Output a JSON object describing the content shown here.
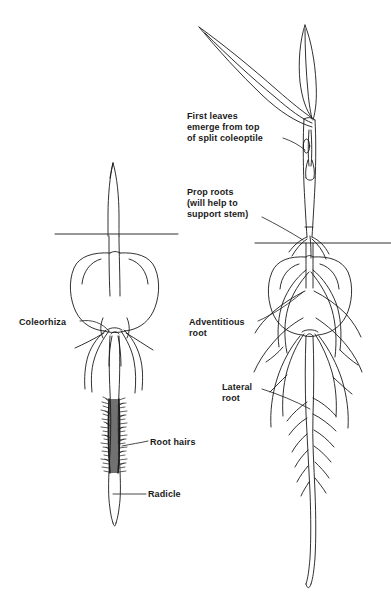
{
  "figure": {
    "background_color": "#ffffff",
    "ink_color": "#1a1a1a",
    "width": 391,
    "height": 610
  },
  "labels": {
    "first_leaves": "First leaves\nemerge from top\nof split coleoptile",
    "prop_roots": "Prop roots\n(will help to\nsupport stem)",
    "coleorhiza": "Coleorhiza",
    "adventitious_root": "Adventitious\nroot",
    "lateral_root": "Lateral\nroot",
    "root_hairs": "Root hairs",
    "radicle": "Radicle"
  },
  "specimens": [
    {
      "name": "young-seedling",
      "position": "left",
      "parts": [
        "coleoptile",
        "soil-line",
        "seed-grain",
        "coleorhiza",
        "seminal-roots",
        "root-hairs",
        "radicle"
      ]
    },
    {
      "name": "older-seedling",
      "position": "right",
      "parts": [
        "first-leaves",
        "split-coleoptile",
        "stem",
        "prop-roots",
        "soil-line",
        "seed-grain",
        "adventitious-roots",
        "lateral-roots",
        "primary-root"
      ]
    }
  ]
}
